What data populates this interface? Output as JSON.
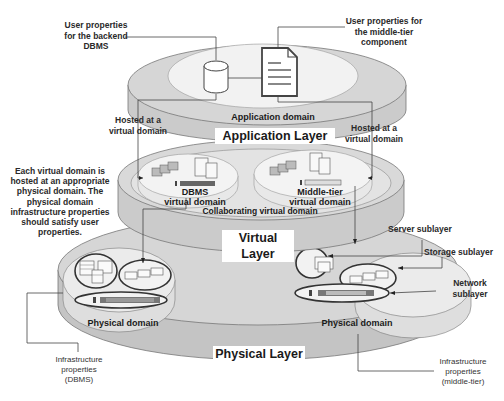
{
  "diagram": {
    "layers": [
      {
        "id": "application",
        "title": "Application Layer",
        "domain_label": "Application domain"
      },
      {
        "id": "virtual",
        "title": "Virtual Layer",
        "domain_labels": [
          "DBMS\nvirtual domain",
          "Middle-tier\nvirtual domain"
        ],
        "collab_label": "Collaborating virtual domain"
      },
      {
        "id": "physical",
        "title": "Physical Layer",
        "domain_labels": [
          "Physical domain",
          "Physical domain"
        ]
      }
    ],
    "callouts": {
      "user_props_backend": "User properties for the backend DBMS",
      "user_props_middle": "User properties for the middle-tier component",
      "hosted_left": "Hosted at a virtual domain",
      "hosted_right": "Hosted at a virtual domain",
      "explanation": "Each virtual domain is hosted at an appropriate physical domain. The physical domain infrastructure properties should satisfy user properties.",
      "server_sublayer": "Server sublayer",
      "storage_sublayer": "Storage sublayer",
      "network_sublayer": "Network sublayer",
      "infra_dbms": "Infrastructure properties (DBMS)",
      "infra_middle": "Infrastructure properties (middle-tier)"
    },
    "labels": {
      "app_layer": "Application Layer",
      "app_domain": "Application domain",
      "virtual_layer": "Virtual Layer",
      "dbms_vd_1": "DBMS",
      "dbms_vd_2": "virtual domain",
      "mid_vd_1": "Middle-tier",
      "mid_vd_2": "virtual domain",
      "collab": "Collaborating virtual domain",
      "physical_layer": "Physical Layer",
      "phys_domain_left": "Physical domain",
      "phys_domain_right": "Physical domain"
    },
    "colors": {
      "disk_dark": "#c9c9c9",
      "disk_mid": "#d8d8d8",
      "disk_light": "#ececec",
      "inner_light": "#f4f4f4",
      "outline": "#555555"
    }
  }
}
